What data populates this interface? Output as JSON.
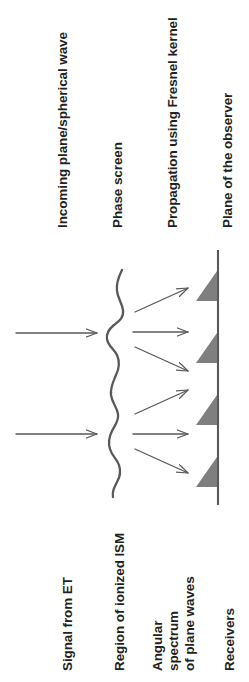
{
  "figure": {
    "type": "schematic-diagram",
    "background_color": "#ffffff",
    "line_color": "#595959",
    "text_color": "#231f20",
    "receiver_fill": "#7f7f7f"
  },
  "top_labels": [
    {
      "id": "incoming-wave",
      "text": "Incoming plane/spherical wave"
    },
    {
      "id": "phase-screen",
      "text": "Phase screen"
    },
    {
      "id": "propagation",
      "text": "Propagation using Fresnel kernel"
    },
    {
      "id": "observer-plane",
      "text": "Plane of the observer"
    }
  ],
  "bottom_labels": [
    {
      "id": "signal-from-et",
      "text": "Signal from ET"
    },
    {
      "id": "region-ionized-ism",
      "text": "Region of ionized ISM"
    },
    {
      "id": "angular-spectrum",
      "text": "Angular spectrum\nof plane waves"
    },
    {
      "id": "receivers",
      "text": "Receivers"
    }
  ],
  "elements": {
    "incoming_arrows": {
      "count": 2,
      "direction": "horizontal-right"
    },
    "phase_screen_wave": {
      "shape": "vertical-squiggle"
    },
    "scattered_arrows": {
      "count": 6,
      "description": "angular spectrum of plane waves fanning toward the observer plane"
    },
    "observer_line": {
      "orientation": "vertical"
    },
    "receivers": {
      "count": 4,
      "shape": "right-triangle"
    }
  }
}
